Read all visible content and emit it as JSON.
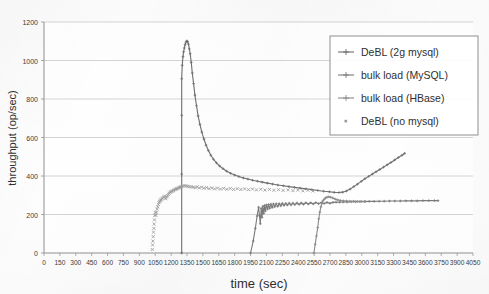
{
  "chart_data": {
    "type": "line",
    "title": "",
    "xlabel": "time (sec)",
    "ylabel": "throughput (op/sec)",
    "xlim": [
      0,
      4050
    ],
    "ylim": [
      0,
      1200
    ],
    "xtick_step": 150,
    "ytick_step": 200,
    "grid": "horizontal",
    "legend_position": "top-right",
    "xticks": [
      "0",
      "150",
      "300",
      "450",
      "600",
      "750",
      "900",
      "1050",
      "1200",
      "1350",
      "1500",
      "1650",
      "1800",
      "1950",
      "2100",
      "2250",
      "2400",
      "2550",
      "2700",
      "2850",
      "3000",
      "3150",
      "3300",
      "3450",
      "3600",
      "3750",
      "3900",
      "4050"
    ],
    "yticks": [
      "0",
      "200",
      "400",
      "600",
      "800",
      "1000",
      "1200"
    ],
    "series": [
      {
        "name": "DeBL (2g mysql)",
        "marker": "plus",
        "color": "#6e6e6e",
        "points": [
          [
            1300,
            0
          ],
          [
            1300,
            410
          ],
          [
            1300,
            715
          ],
          [
            1300,
            905
          ],
          [
            1305,
            975
          ],
          [
            1312,
            1020
          ],
          [
            1318,
            1045
          ],
          [
            1325,
            1065
          ],
          [
            1332,
            1082
          ],
          [
            1340,
            1095
          ],
          [
            1348,
            1102
          ],
          [
            1356,
            1098
          ],
          [
            1364,
            1085
          ],
          [
            1372,
            1060
          ],
          [
            1380,
            1035
          ],
          [
            1390,
            990
          ],
          [
            1400,
            935
          ],
          [
            1412,
            880
          ],
          [
            1425,
            820
          ],
          [
            1440,
            765
          ],
          [
            1455,
            712
          ],
          [
            1472,
            668
          ],
          [
            1490,
            628
          ],
          [
            1510,
            592
          ],
          [
            1530,
            560
          ],
          [
            1552,
            532
          ],
          [
            1575,
            508
          ],
          [
            1600,
            487
          ],
          [
            1628,
            468
          ],
          [
            1658,
            452
          ],
          [
            1690,
            438
          ],
          [
            1725,
            425
          ],
          [
            1762,
            414
          ],
          [
            1800,
            405
          ],
          [
            1840,
            397
          ],
          [
            1882,
            390
          ],
          [
            1925,
            384
          ],
          [
            1970,
            378
          ],
          [
            2015,
            373
          ],
          [
            2060,
            368
          ],
          [
            2108,
            363
          ],
          [
            2158,
            358
          ],
          [
            2208,
            353
          ],
          [
            2260,
            349
          ],
          [
            2312,
            345
          ],
          [
            2365,
            341
          ],
          [
            2418,
            337
          ],
          [
            2472,
            333
          ],
          [
            2528,
            329
          ],
          [
            2585,
            325
          ],
          [
            2640,
            321
          ],
          [
            2695,
            318
          ],
          [
            2740,
            315
          ],
          [
            2785,
            314
          ],
          [
            2820,
            316
          ],
          [
            2855,
            322
          ],
          [
            2890,
            332
          ],
          [
            2925,
            345
          ],
          [
            2960,
            358
          ],
          [
            2995,
            372
          ],
          [
            3030,
            386
          ],
          [
            3065,
            398
          ],
          [
            3100,
            410
          ],
          [
            3135,
            422
          ],
          [
            3170,
            434
          ],
          [
            3205,
            446
          ],
          [
            3240,
            458
          ],
          [
            3275,
            470
          ],
          [
            3310,
            483
          ],
          [
            3345,
            496
          ],
          [
            3380,
            508
          ],
          [
            3405,
            518
          ]
        ]
      },
      {
        "name": "bulk load (MySQL)",
        "marker": "plus",
        "color": "#7a7a7a",
        "points": [
          [
            1950,
            0
          ],
          [
            1975,
            62
          ],
          [
            1995,
            128
          ],
          [
            2012,
            192
          ],
          [
            2026,
            238
          ],
          [
            2034,
            196
          ],
          [
            2042,
            152
          ],
          [
            2050,
            232
          ],
          [
            2058,
            185
          ],
          [
            2066,
            243
          ],
          [
            2074,
            205
          ],
          [
            2082,
            247
          ],
          [
            2090,
            218
          ],
          [
            2100,
            250
          ],
          [
            2110,
            228
          ],
          [
            2120,
            252
          ],
          [
            2130,
            232
          ],
          [
            2142,
            254
          ],
          [
            2154,
            236
          ],
          [
            2166,
            255
          ],
          [
            2178,
            240
          ],
          [
            2192,
            256
          ],
          [
            2206,
            242
          ],
          [
            2220,
            257
          ],
          [
            2235,
            245
          ],
          [
            2250,
            258
          ],
          [
            2266,
            247
          ],
          [
            2282,
            258
          ],
          [
            2298,
            249
          ],
          [
            2315,
            259
          ],
          [
            2332,
            250
          ],
          [
            2350,
            259
          ],
          [
            2368,
            251
          ],
          [
            2388,
            260
          ],
          [
            2408,
            252
          ],
          [
            2428,
            260
          ],
          [
            2450,
            253
          ],
          [
            2472,
            261
          ],
          [
            2495,
            254
          ],
          [
            2518,
            261
          ],
          [
            2542,
            255
          ],
          [
            2566,
            262
          ],
          [
            2592,
            256
          ],
          [
            2618,
            262
          ],
          [
            2645,
            257
          ],
          [
            2672,
            263
          ],
          [
            2700,
            258
          ],
          [
            2728,
            263
          ],
          [
            2758,
            264
          ],
          [
            2790,
            264
          ],
          [
            2825,
            265
          ],
          [
            2862,
            265
          ],
          [
            2900,
            266
          ],
          [
            2940,
            266
          ],
          [
            2982,
            267
          ],
          [
            3025,
            267
          ],
          [
            3070,
            268
          ],
          [
            3116,
            268
          ],
          [
            3164,
            269
          ],
          [
            3212,
            269
          ],
          [
            3262,
            270
          ],
          [
            3312,
            270
          ],
          [
            3364,
            270
          ],
          [
            3416,
            271
          ],
          [
            3470,
            271
          ],
          [
            3524,
            271
          ],
          [
            3578,
            272
          ],
          [
            3632,
            272
          ],
          [
            3686,
            272
          ],
          [
            3720,
            272
          ]
        ]
      },
      {
        "name": "bulk load (HBase)",
        "marker": "plus",
        "color": "#8a8a8a",
        "points": [
          [
            2548,
            0
          ],
          [
            2560,
            45
          ],
          [
            2572,
            88
          ],
          [
            2584,
            132
          ],
          [
            2594,
            178
          ],
          [
            2604,
            212
          ],
          [
            2614,
            240
          ],
          [
            2624,
            258
          ],
          [
            2634,
            272
          ],
          [
            2646,
            280
          ],
          [
            2658,
            286
          ],
          [
            2672,
            290
          ],
          [
            2688,
            292
          ],
          [
            2706,
            290
          ],
          [
            2726,
            286
          ],
          [
            2748,
            280
          ],
          [
            2772,
            276
          ],
          [
            2798,
            273
          ],
          [
            2826,
            271
          ],
          [
            2856,
            270
          ],
          [
            2888,
            269
          ],
          [
            2922,
            269
          ],
          [
            2958,
            268
          ],
          [
            2996,
            268
          ],
          [
            3036,
            268
          ]
        ]
      },
      {
        "name": "DeBL (no mysql)",
        "marker": "x",
        "color": "#9a9a9a",
        "points": [
          [
            1022,
            18
          ],
          [
            1025,
            42
          ],
          [
            1028,
            62
          ],
          [
            1031,
            85
          ],
          [
            1034,
            108
          ],
          [
            1037,
            128
          ],
          [
            1040,
            150
          ],
          [
            1043,
            172
          ],
          [
            1046,
            196
          ],
          [
            1050,
            210
          ],
          [
            1056,
            196
          ],
          [
            1062,
            212
          ],
          [
            1068,
            228
          ],
          [
            1074,
            240
          ],
          [
            1080,
            252
          ],
          [
            1086,
            262
          ],
          [
            1092,
            268
          ],
          [
            1098,
            272
          ],
          [
            1104,
            276
          ],
          [
            1110,
            280
          ],
          [
            1118,
            284
          ],
          [
            1126,
            288
          ],
          [
            1134,
            292
          ],
          [
            1142,
            295
          ],
          [
            1150,
            282
          ],
          [
            1158,
            290
          ],
          [
            1166,
            298
          ],
          [
            1174,
            304
          ],
          [
            1182,
            310
          ],
          [
            1190,
            315
          ],
          [
            1198,
            318
          ],
          [
            1206,
            320
          ],
          [
            1214,
            322
          ],
          [
            1222,
            325
          ],
          [
            1230,
            328
          ],
          [
            1238,
            330
          ],
          [
            1246,
            332
          ],
          [
            1254,
            334
          ],
          [
            1262,
            336
          ],
          [
            1270,
            338
          ],
          [
            1278,
            340
          ],
          [
            1286,
            342
          ],
          [
            1294,
            344
          ],
          [
            1302,
            346
          ],
          [
            1316,
            348
          ],
          [
            1330,
            350
          ],
          [
            1344,
            348
          ],
          [
            1358,
            346
          ],
          [
            1372,
            344
          ],
          [
            1390,
            344
          ],
          [
            1408,
            342
          ],
          [
            1426,
            340
          ],
          [
            1446,
            344
          ],
          [
            1466,
            338
          ],
          [
            1488,
            342
          ],
          [
            1510,
            336
          ],
          [
            1534,
            340
          ],
          [
            1558,
            334
          ],
          [
            1584,
            338
          ],
          [
            1610,
            333
          ],
          [
            1638,
            337
          ],
          [
            1666,
            332
          ],
          [
            1696,
            336
          ],
          [
            1726,
            331
          ],
          [
            1758,
            335
          ],
          [
            1790,
            330
          ],
          [
            1824,
            334
          ],
          [
            1858,
            330
          ],
          [
            1894,
            333
          ],
          [
            1930,
            329
          ],
          [
            1968,
            332
          ],
          [
            2006,
            328
          ],
          [
            2046,
            331
          ],
          [
            2086,
            327
          ],
          [
            2128,
            330
          ],
          [
            2170,
            326
          ],
          [
            2214,
            329
          ],
          [
            2258,
            325
          ],
          [
            2304,
            328
          ],
          [
            2350,
            324
          ],
          [
            2396,
            327
          ],
          [
            2444,
            323
          ],
          [
            2492,
            326
          ],
          [
            2540,
            322
          ]
        ]
      }
    ]
  },
  "legend": {
    "entries": [
      {
        "label": "DeBL (2g mysql)",
        "marker": "line-plus"
      },
      {
        "label": "bulk load (MySQL)",
        "marker": "line-plus"
      },
      {
        "label": "bulk load (HBase)",
        "marker": "line-plus"
      },
      {
        "label": "DeBL (no mysql)",
        "marker": "dot"
      }
    ]
  },
  "colors": {
    "grid": "#c9c9c9",
    "axis": "#8f8f8f",
    "text": "#2f2f2f",
    "series_1": "#6e6e6e",
    "series_2": "#7a7a7a",
    "series_3": "#8a8a8a",
    "series_4": "#9a9a9a",
    "legend_border": "#8f8f8f",
    "background": "#fdfdfd"
  }
}
